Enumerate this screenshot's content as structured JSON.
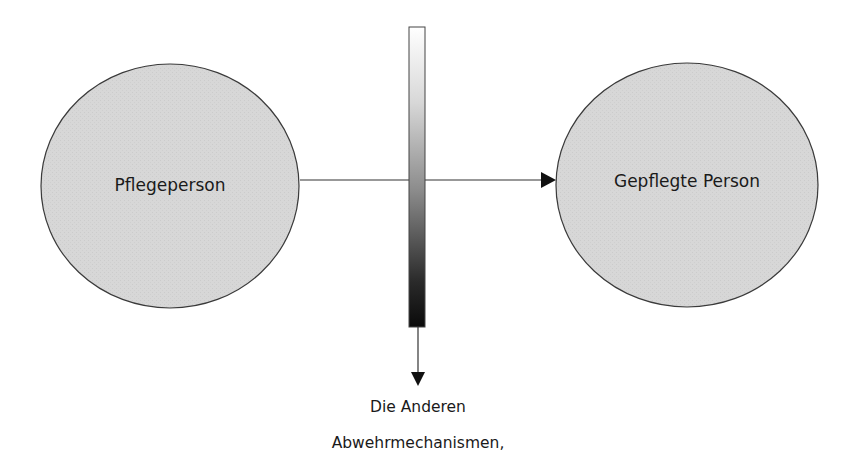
{
  "diagram": {
    "nodes": [
      {
        "id": "pflegeperson",
        "label": "Pflegeperson"
      },
      {
        "id": "gepflegte-person",
        "label": "Gepflegte Person"
      }
    ],
    "barrier": {
      "gradient": [
        "#ffffff",
        "#111111"
      ]
    },
    "bottom_labels": {
      "line1": "Die Anderen",
      "line2": "Abwehrmechanismen,"
    },
    "colors": {
      "node_fill": "#d6d6d6",
      "stroke": "#333333",
      "arrow": "#111111"
    }
  }
}
